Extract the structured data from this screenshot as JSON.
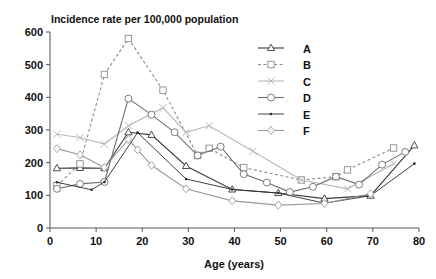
{
  "chart_data": {
    "type": "line",
    "title": "Incidence rate per 100,000 population",
    "xlabel": "Age (years)",
    "ylabel": "",
    "xlim": [
      0,
      80
    ],
    "ylim": [
      0,
      600
    ],
    "xticks": [
      0,
      10,
      20,
      30,
      40,
      50,
      60,
      70,
      80
    ],
    "yticks": [
      0,
      100,
      200,
      300,
      400,
      500,
      600
    ],
    "grid": false,
    "legend_position": "upper right",
    "series": [
      {
        "name": "A",
        "marker": "triangle",
        "linestyle": "solid",
        "color": "#3a3a3a",
        "points": [
          [
            1.5,
            183
          ],
          [
            6.5,
            184
          ],
          [
            11.8,
            183
          ],
          [
            17,
            293
          ],
          [
            22,
            285
          ],
          [
            29.5,
            190
          ],
          [
            39.5,
            118
          ],
          [
            49.5,
            107
          ],
          [
            59.5,
            90
          ],
          [
            69.5,
            99
          ],
          [
            79,
            253
          ]
        ]
      },
      {
        "name": "B",
        "marker": "square",
        "linestyle": "dashed",
        "color": "#8c8c8c",
        "points": [
          [
            1.5,
            130
          ],
          [
            6.5,
            196
          ],
          [
            11.8,
            470
          ],
          [
            17,
            580
          ],
          [
            24.5,
            422
          ],
          [
            32,
            222
          ],
          [
            34.5,
            244
          ],
          [
            42,
            185
          ],
          [
            54.5,
            147
          ],
          [
            62,
            157
          ],
          [
            64.5,
            178
          ],
          [
            74.5,
            245
          ]
        ]
      },
      {
        "name": "C",
        "marker": "x",
        "linestyle": "solid",
        "color": "#b8b8b8",
        "points": [
          [
            1.5,
            287
          ],
          [
            6.5,
            277
          ],
          [
            11.8,
            257
          ],
          [
            17,
            313
          ],
          [
            24.5,
            368
          ],
          [
            29.5,
            293
          ],
          [
            34.5,
            313
          ],
          [
            44,
            235
          ],
          [
            54.5,
            147
          ],
          [
            64.5,
            120
          ],
          [
            74.5,
            196
          ]
        ]
      },
      {
        "name": "D",
        "marker": "circle",
        "linestyle": "solid",
        "color": "#6e6e6e",
        "points": [
          [
            1.5,
            120
          ],
          [
            6.5,
            135
          ],
          [
            11.8,
            141
          ],
          [
            17,
            396
          ],
          [
            22,
            347
          ],
          [
            27,
            293
          ],
          [
            32,
            222
          ],
          [
            37,
            249
          ],
          [
            42,
            165
          ],
          [
            47,
            139
          ],
          [
            52,
            110
          ],
          [
            57,
            126
          ],
          [
            62,
            157
          ],
          [
            67,
            133
          ],
          [
            72,
            194
          ],
          [
            77,
            233
          ]
        ]
      },
      {
        "name": "E",
        "marker": "dot",
        "linestyle": "solid",
        "color": "#2b2b2b",
        "points": [
          [
            1.5,
            140
          ],
          [
            9,
            117
          ],
          [
            11.8,
            141
          ],
          [
            19,
            292
          ],
          [
            29.5,
            150
          ],
          [
            39.5,
            118
          ],
          [
            49.5,
            107
          ],
          [
            59.5,
            76
          ],
          [
            69.5,
            99
          ],
          [
            79,
            197
          ]
        ]
      },
      {
        "name": "F",
        "marker": "diamond",
        "linestyle": "solid",
        "color": "#9a9a9a",
        "points": [
          [
            1.5,
            243
          ],
          [
            6.5,
            224
          ],
          [
            11.8,
            185
          ],
          [
            17,
            271
          ],
          [
            19,
            239
          ],
          [
            22,
            192
          ],
          [
            29.5,
            120
          ],
          [
            39.5,
            83
          ],
          [
            49.5,
            70
          ],
          [
            59.5,
            75
          ],
          [
            69.5,
            105
          ]
        ]
      }
    ]
  },
  "legend": {
    "entries": [
      {
        "label": "A"
      },
      {
        "label": "B"
      },
      {
        "label": "C"
      },
      {
        "label": "D"
      },
      {
        "label": "E"
      },
      {
        "label": "F"
      }
    ]
  }
}
